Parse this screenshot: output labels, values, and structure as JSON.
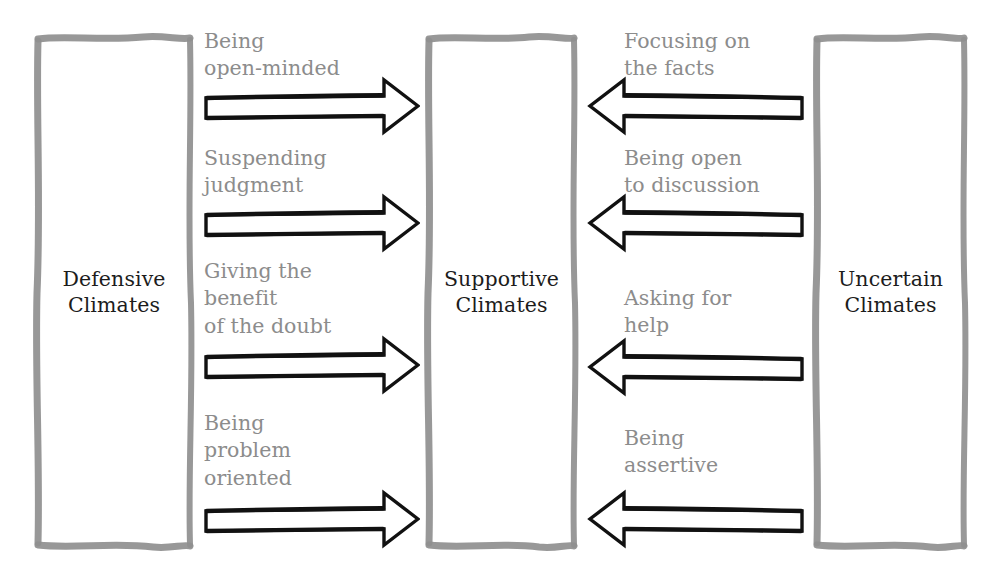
{
  "diagram": {
    "title_text_color": "#1c1c1c",
    "label_text_color": "#8c8c8c",
    "box_border_color": "#8f8f8f",
    "arrow_color": "#111111",
    "background": "#ffffff",
    "boxes": [
      {
        "id": "defensive",
        "label": "Defensive\nClimates"
      },
      {
        "id": "supportive",
        "label": "Supportive\nClimates"
      },
      {
        "id": "uncertain",
        "label": "Uncertain\nClimates"
      }
    ],
    "left_arrows": [
      {
        "label": "Being\nopen-minded",
        "direction": "right"
      },
      {
        "label": "Suspending\njudgment",
        "direction": "right"
      },
      {
        "label": "Giving the\nbenefit\nof the doubt",
        "direction": "right"
      },
      {
        "label": "Being\nproblem\noriented",
        "direction": "right"
      }
    ],
    "right_arrows": [
      {
        "label": "Focusing on\nthe facts",
        "direction": "left"
      },
      {
        "label": "Being open\nto discussion",
        "direction": "left"
      },
      {
        "label": "Asking for\nhelp",
        "direction": "left"
      },
      {
        "label": "Being\nassertive",
        "direction": "left"
      }
    ]
  }
}
